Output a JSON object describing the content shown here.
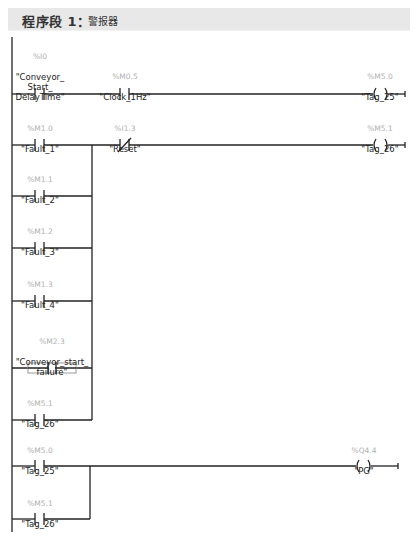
{
  "network": {
    "title": "程序段 1：",
    "comment": "警报器"
  },
  "elements": {
    "c1": {
      "address": "%I0",
      "name": "\"Conveyor_\nStart_\nDelayTime\""
    },
    "c2": {
      "address": "%M0.5",
      "name": "\"Clock_1Hz\""
    },
    "q1": {
      "address": "%M5.0",
      "name": "\"Tag_25\""
    },
    "c3": {
      "address": "%M1.0",
      "name": "\"Fault_1\""
    },
    "c4": {
      "address": "%I1.3",
      "name": "\"Reset\""
    },
    "q2": {
      "address": "%M5.1",
      "name": "\"Tag_26\""
    },
    "c5": {
      "address": "%M1.1",
      "name": "\"Fault_2\""
    },
    "c6": {
      "address": "%M1.2",
      "name": "\"Fault_3\""
    },
    "c7": {
      "address": "%M1.3",
      "name": "\"Fault_4\""
    },
    "c8": {
      "address": "%M2.3",
      "name": "\"Conveyor_start_\nfailure\""
    },
    "c9": {
      "address": "%M5.1",
      "name": "\"Tag_26\""
    },
    "c10": {
      "address": "%M5.0",
      "name": "\"Tag_25\""
    },
    "q3": {
      "address": "%Q4.4",
      "name": "\"PG\""
    },
    "c11": {
      "address": "%M5.1",
      "name": "\"Tag_26\""
    }
  },
  "colors": {
    "line": "#222222",
    "address": "#b0b0b0",
    "header_bg": "#e8e8e8"
  }
}
